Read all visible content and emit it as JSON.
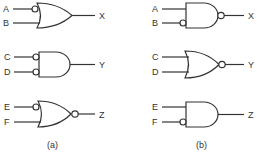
{
  "diagram": {
    "panels": [
      {
        "caption": "(a)",
        "gates": [
          {
            "type": "OR",
            "inputs": [
              {
                "label": "A",
                "inverted": true
              },
              {
                "label": "B",
                "inverted": false
              }
            ],
            "output": {
              "label": "X",
              "inverted": false
            }
          },
          {
            "type": "AND",
            "inputs": [
              {
                "label": "C",
                "inverted": true
              },
              {
                "label": "D",
                "inverted": true
              }
            ],
            "output": {
              "label": "Y",
              "inverted": false
            }
          },
          {
            "type": "OR",
            "inputs": [
              {
                "label": "E",
                "inverted": true
              },
              {
                "label": "F",
                "inverted": false
              }
            ],
            "output": {
              "label": "Z",
              "inverted": true
            }
          }
        ]
      },
      {
        "caption": "(b)",
        "gates": [
          {
            "type": "AND",
            "inputs": [
              {
                "label": "A",
                "inverted": false
              },
              {
                "label": "B",
                "inverted": true
              }
            ],
            "output": {
              "label": "X",
              "inverted": true
            }
          },
          {
            "type": "OR",
            "inputs": [
              {
                "label": "C",
                "inverted": false
              },
              {
                "label": "D",
                "inverted": false
              }
            ],
            "output": {
              "label": "Y",
              "inverted": true
            }
          },
          {
            "type": "AND",
            "inputs": [
              {
                "label": "E",
                "inverted": false
              },
              {
                "label": "F",
                "inverted": true
              }
            ],
            "output": {
              "label": "Z",
              "inverted": false
            }
          }
        ]
      }
    ]
  }
}
